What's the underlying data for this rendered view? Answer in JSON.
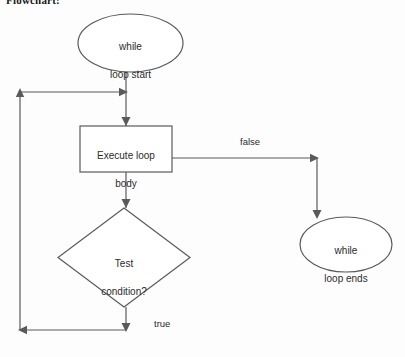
{
  "document": {
    "title": "Flowchart:",
    "background_color": "#fdfdfd",
    "line_color": "#5a5a5a",
    "text_color": "#2b2b2b"
  },
  "diagram": {
    "type": "flowchart",
    "nodes": [
      {
        "id": "start",
        "shape": "ellipse",
        "label": "while\nloop start",
        "line1": "while",
        "line2": "loop start"
      },
      {
        "id": "body",
        "shape": "rectangle",
        "label": "Execute loop\nbody",
        "line1": "Execute loop",
        "line2": "body"
      },
      {
        "id": "test",
        "shape": "diamond",
        "label": "Test\ncondition?",
        "line1": "Test",
        "line2": "condition?"
      },
      {
        "id": "end",
        "shape": "ellipse",
        "label": "while\nloop ends",
        "line1": "while",
        "line2": "loop ends"
      }
    ],
    "edges": [
      {
        "id": "start-to-body",
        "from": "start",
        "to": "body",
        "label": ""
      },
      {
        "id": "body-to-test",
        "from": "body",
        "to": "test",
        "label": ""
      },
      {
        "id": "body-to-end",
        "from": "body",
        "to": "end",
        "label": "false"
      },
      {
        "id": "test-to-loopback",
        "from": "test",
        "to": "body",
        "label": "true"
      }
    ],
    "edge_labels": {
      "false": "false",
      "true": "true"
    }
  }
}
